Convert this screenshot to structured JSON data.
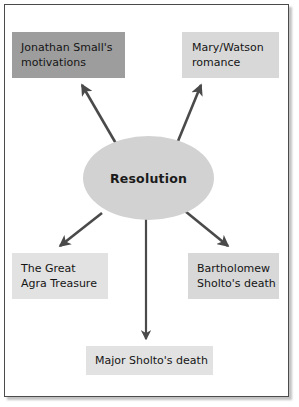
{
  "diagram": {
    "type": "spider-web-concept-map",
    "center": {
      "label": "Resolution",
      "shape": "ellipse",
      "fill": "#d2d2d2"
    },
    "frame": {
      "border_color": "#4b4b4b",
      "background": "#ffffff"
    },
    "nodes": [
      {
        "id": "jonathan-small-motivations",
        "lines": [
          "Jonathan Small's",
          "motivations"
        ],
        "fill": "#9d9d9d",
        "position": "top-left"
      },
      {
        "id": "mary-watson-romance",
        "lines": [
          "Mary/Watson",
          "romance"
        ],
        "fill": "#d8d8d8",
        "position": "top-right"
      },
      {
        "id": "great-agra-treasure",
        "lines": [
          "The Great",
          "Agra Treasure"
        ],
        "fill": "#e2e2e2",
        "position": "bottom-left"
      },
      {
        "id": "bartholomew-sholto-death",
        "lines": [
          "Bartholomew",
          "Sholto's death"
        ],
        "fill": "#d8d8d8",
        "position": "bottom-right"
      },
      {
        "id": "major-sholto-death",
        "lines": [
          "Major Sholto's death"
        ],
        "fill": "#e2e2e2",
        "position": "bottom-center"
      }
    ],
    "connectors": [
      {
        "id": "arrow-to-jonathan-small-motivations",
        "from": "center",
        "to": "jonathan-small-motivations",
        "direction": "up-left",
        "color": "#4a4a4a"
      },
      {
        "id": "arrow-to-mary-watson-romance",
        "from": "center",
        "to": "mary-watson-romance",
        "direction": "up-right",
        "color": "#4a4a4a"
      },
      {
        "id": "arrow-to-great-agra-treasure",
        "from": "center",
        "to": "great-agra-treasure",
        "direction": "down-left",
        "color": "#4a4a4a"
      },
      {
        "id": "arrow-to-bartholomew-sholto-death",
        "from": "center",
        "to": "bartholomew-sholto-death",
        "direction": "down-right",
        "color": "#4a4a4a"
      },
      {
        "id": "arrow-to-major-sholto-death",
        "from": "center",
        "to": "major-sholto-death",
        "direction": "down",
        "color": "#4a4a4a"
      }
    ]
  }
}
